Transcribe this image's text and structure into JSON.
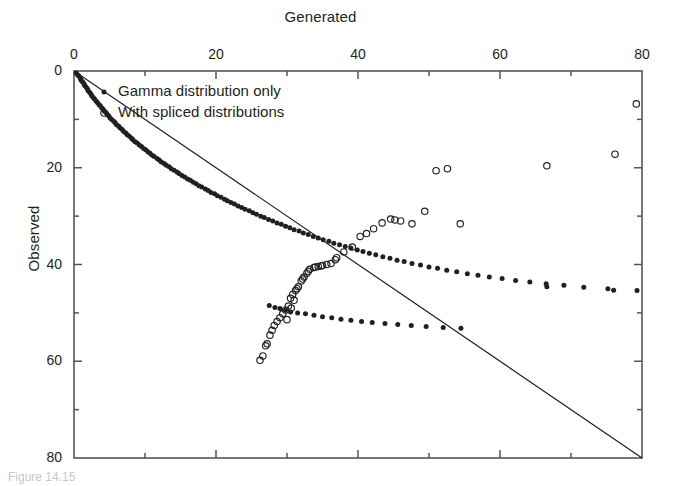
{
  "figure": {
    "background": "#ffffff",
    "ink_color": "#231f20",
    "axis_color": "#55555a",
    "caption_partial": "Figure 14.15"
  },
  "axes": {
    "x_title": "Generated",
    "y_title": "Observed",
    "x_title_position": "top",
    "y_title_position": "left",
    "x_major_ticks": [
      "0",
      "20",
      "40",
      "60",
      "80"
    ],
    "x_major_values": [
      0,
      20,
      40,
      60,
      80
    ],
    "x_minor_values": [
      10,
      30,
      50,
      70
    ],
    "y_major_ticks": [
      "0",
      "20",
      "40",
      "60",
      "80"
    ],
    "y_major_values": [
      0,
      20,
      40,
      60,
      80
    ],
    "y_minor_values": [
      10,
      30,
      50,
      70
    ],
    "y_inverted": true
  },
  "legend": {
    "position": "inside-top-left",
    "entries": [
      {
        "marker": "filled-dot",
        "label": "Gamma distribution only"
      },
      {
        "marker": "open-circle",
        "label": "With spliced distributions"
      }
    ]
  },
  "chart_data": {
    "type": "scatter",
    "title": "",
    "xlabel": "Generated",
    "ylabel": "Observed",
    "xlim": [
      0,
      80
    ],
    "ylim": [
      0,
      80
    ],
    "y_axis_inverted": true,
    "grid": false,
    "legend_position": "inside-top-left",
    "reference_line": {
      "name": "one-to-one line",
      "x": [
        0,
        80
      ],
      "y": [
        0,
        80
      ],
      "style": "solid",
      "color": "#231f20"
    },
    "series": [
      {
        "name": "Gamma distribution only",
        "marker": "filled-dot",
        "color": "#231f20",
        "points": [
          [
            0.3,
            0.4
          ],
          [
            0.5,
            0.8
          ],
          [
            0.7,
            1.1
          ],
          [
            0.9,
            1.5
          ],
          [
            1.0,
            1.9
          ],
          [
            1.2,
            2.2
          ],
          [
            1.4,
            2.6
          ],
          [
            1.5,
            3.0
          ],
          [
            1.7,
            3.3
          ],
          [
            1.9,
            3.7
          ],
          [
            2.0,
            4.1
          ],
          [
            2.2,
            4.4
          ],
          [
            2.4,
            4.8
          ],
          [
            2.5,
            5.1
          ],
          [
            2.7,
            5.5
          ],
          [
            2.9,
            5.8
          ],
          [
            3.1,
            6.2
          ],
          [
            3.3,
            6.5
          ],
          [
            3.5,
            6.9
          ],
          [
            3.7,
            7.2
          ],
          [
            3.9,
            7.6
          ],
          [
            4.1,
            7.9
          ],
          [
            4.3,
            8.3
          ],
          [
            4.5,
            8.6
          ],
          [
            4.7,
            9.0
          ],
          [
            4.9,
            9.3
          ],
          [
            5.1,
            9.7
          ],
          [
            5.3,
            10.0
          ],
          [
            5.6,
            10.4
          ],
          [
            5.8,
            10.7
          ],
          [
            6.0,
            11.1
          ],
          [
            6.3,
            11.4
          ],
          [
            6.5,
            11.8
          ],
          [
            6.8,
            12.1
          ],
          [
            7.0,
            12.5
          ],
          [
            7.3,
            12.8
          ],
          [
            7.5,
            13.2
          ],
          [
            7.8,
            13.5
          ],
          [
            8.1,
            13.9
          ],
          [
            8.3,
            14.2
          ],
          [
            8.6,
            14.6
          ],
          [
            8.9,
            14.9
          ],
          [
            9.2,
            15.3
          ],
          [
            9.5,
            15.6
          ],
          [
            9.8,
            16.0
          ],
          [
            10.1,
            16.3
          ],
          [
            10.4,
            16.7
          ],
          [
            10.7,
            17.0
          ],
          [
            11.0,
            17.4
          ],
          [
            11.3,
            17.7
          ],
          [
            11.7,
            18.1
          ],
          [
            12.0,
            18.4
          ],
          [
            12.3,
            18.8
          ],
          [
            12.7,
            19.1
          ],
          [
            13.0,
            19.5
          ],
          [
            13.4,
            19.8
          ],
          [
            13.7,
            20.2
          ],
          [
            14.1,
            20.5
          ],
          [
            14.5,
            20.9
          ],
          [
            14.8,
            21.2
          ],
          [
            15.2,
            21.6
          ],
          [
            15.6,
            21.9
          ],
          [
            16.0,
            22.3
          ],
          [
            16.4,
            22.6
          ],
          [
            16.8,
            23.0
          ],
          [
            17.2,
            23.3
          ],
          [
            17.6,
            23.7
          ],
          [
            18.0,
            24.0
          ],
          [
            18.5,
            24.4
          ],
          [
            18.9,
            24.7
          ],
          [
            19.3,
            25.1
          ],
          [
            19.8,
            25.4
          ],
          [
            20.2,
            25.8
          ],
          [
            20.7,
            26.1
          ],
          [
            21.2,
            26.5
          ],
          [
            21.6,
            26.8
          ],
          [
            22.1,
            27.2
          ],
          [
            22.6,
            27.5
          ],
          [
            23.1,
            27.9
          ],
          [
            23.6,
            28.2
          ],
          [
            24.1,
            28.6
          ],
          [
            24.7,
            28.9
          ],
          [
            25.2,
            29.3
          ],
          [
            25.7,
            29.6
          ],
          [
            26.3,
            30.0
          ],
          [
            26.8,
            30.3
          ],
          [
            27.4,
            30.7
          ],
          [
            28.0,
            31.0
          ],
          [
            28.6,
            31.4
          ],
          [
            29.2,
            31.7
          ],
          [
            29.8,
            32.1
          ],
          [
            30.4,
            32.4
          ],
          [
            31.0,
            32.8
          ],
          [
            31.7,
            33.1
          ],
          [
            32.3,
            33.5
          ],
          [
            33.0,
            33.8
          ],
          [
            33.7,
            34.2
          ],
          [
            34.4,
            34.5
          ],
          [
            35.1,
            34.9
          ],
          [
            35.9,
            35.2
          ],
          [
            36.6,
            35.6
          ],
          [
            37.4,
            35.9
          ],
          [
            38.2,
            36.3
          ],
          [
            39.0,
            36.6
          ],
          [
            39.9,
            37.0
          ],
          [
            40.7,
            37.3
          ],
          [
            41.6,
            37.7
          ],
          [
            42.5,
            38.0
          ],
          [
            43.5,
            38.4
          ],
          [
            44.5,
            38.7
          ],
          [
            45.5,
            39.1
          ],
          [
            46.5,
            39.4
          ],
          [
            47.6,
            39.8
          ],
          [
            48.8,
            40.1
          ],
          [
            50.0,
            40.5
          ],
          [
            51.2,
            40.8
          ],
          [
            52.5,
            41.2
          ],
          [
            53.9,
            41.5
          ],
          [
            55.4,
            41.9
          ],
          [
            56.9,
            42.2
          ],
          [
            58.5,
            42.6
          ],
          [
            60.3,
            42.9
          ],
          [
            62.2,
            43.3
          ],
          [
            64.2,
            43.6
          ],
          [
            66.5,
            44.0
          ],
          [
            69.0,
            44.3
          ],
          [
            71.8,
            44.7
          ],
          [
            75.2,
            45.0
          ],
          [
            79.3,
            45.4
          ],
          [
            27.5,
            48.5
          ],
          [
            28.3,
            48.9
          ],
          [
            29.0,
            49.1
          ],
          [
            29.8,
            49.4
          ],
          [
            30.5,
            49.8
          ],
          [
            31.5,
            50.0
          ],
          [
            32.6,
            50.2
          ],
          [
            33.8,
            50.5
          ],
          [
            35.0,
            50.8
          ],
          [
            36.3,
            51.0
          ],
          [
            37.6,
            51.3
          ],
          [
            39.0,
            51.5
          ],
          [
            40.5,
            51.8
          ],
          [
            42.0,
            52.0
          ],
          [
            43.8,
            52.2
          ],
          [
            45.6,
            52.4
          ],
          [
            47.5,
            52.6
          ],
          [
            49.6,
            52.8
          ],
          [
            52.0,
            53.0
          ],
          [
            54.5,
            53.2
          ],
          [
            66.6,
            44.6
          ],
          [
            76.0,
            45.3
          ]
        ]
      },
      {
        "name": "With spliced distributions",
        "marker": "open-circle",
        "color": "#231f20",
        "points": [
          [
            26.2,
            59.8
          ],
          [
            26.6,
            58.9
          ],
          [
            27.0,
            56.8
          ],
          [
            27.2,
            56.4
          ],
          [
            27.6,
            54.6
          ],
          [
            27.9,
            53.6
          ],
          [
            28.2,
            52.6
          ],
          [
            28.6,
            51.8
          ],
          [
            29.0,
            51.0
          ],
          [
            29.4,
            50.2
          ],
          [
            29.8,
            49.4
          ],
          [
            30.2,
            48.6
          ],
          [
            30.5,
            47.0
          ],
          [
            30.8,
            46.2
          ],
          [
            31.2,
            45.4
          ],
          [
            31.6,
            44.6
          ],
          [
            32.0,
            43.4
          ],
          [
            32.4,
            42.6
          ],
          [
            32.8,
            41.8
          ],
          [
            33.2,
            41.0
          ],
          [
            33.8,
            40.6
          ],
          [
            34.4,
            40.4
          ],
          [
            35.0,
            40.2
          ],
          [
            35.6,
            40.0
          ],
          [
            36.2,
            39.8
          ],
          [
            37.0,
            38.6
          ],
          [
            38.0,
            37.4
          ],
          [
            39.2,
            36.4
          ],
          [
            40.3,
            34.2
          ],
          [
            41.2,
            33.6
          ],
          [
            42.2,
            32.6
          ],
          [
            43.4,
            31.4
          ],
          [
            44.6,
            30.6
          ],
          [
            46.0,
            31.0
          ],
          [
            47.6,
            31.6
          ],
          [
            49.4,
            29.0
          ],
          [
            51.0,
            20.6
          ],
          [
            52.6,
            20.2
          ],
          [
            54.4,
            31.6
          ],
          [
            66.6,
            19.6
          ],
          [
            76.2,
            17.2
          ],
          [
            79.2,
            6.8
          ],
          [
            30.0,
            51.4
          ],
          [
            30.6,
            49.0
          ],
          [
            31.0,
            47.4
          ],
          [
            31.4,
            45.0
          ],
          [
            32.2,
            43.0
          ],
          [
            33.0,
            41.4
          ],
          [
            34.0,
            40.5
          ],
          [
            34.8,
            40.3
          ],
          [
            36.8,
            39.0
          ],
          [
            45.2,
            30.8
          ]
        ]
      }
    ]
  }
}
